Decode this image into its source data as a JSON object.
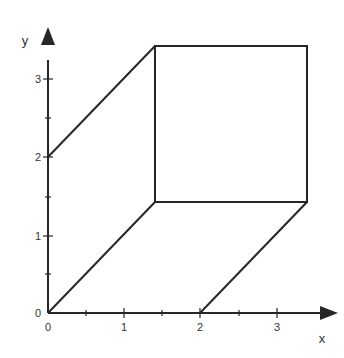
{
  "diagram": {
    "type": "geometric-figure",
    "axes": {
      "x_label": "x",
      "y_label": "y",
      "x_ticks": [
        "0",
        "1",
        "2",
        "3"
      ],
      "y_ticks": [
        "0",
        "1",
        "2",
        "3"
      ]
    },
    "shapes": {
      "square": {
        "x": [
          1.4,
          3.4
        ],
        "y": [
          1.42,
          3.42
        ]
      },
      "segments": [
        {
          "from": [
            0,
            0
          ],
          "to": [
            1.4,
            1.42
          ]
        },
        {
          "from": [
            0,
            2
          ],
          "to": [
            1.4,
            3.42
          ]
        },
        {
          "from": [
            2,
            0
          ],
          "to": [
            3.4,
            1.42
          ]
        }
      ]
    },
    "colors": {
      "line": "#262626",
      "text": "#333333",
      "background": "#ffffff"
    }
  }
}
